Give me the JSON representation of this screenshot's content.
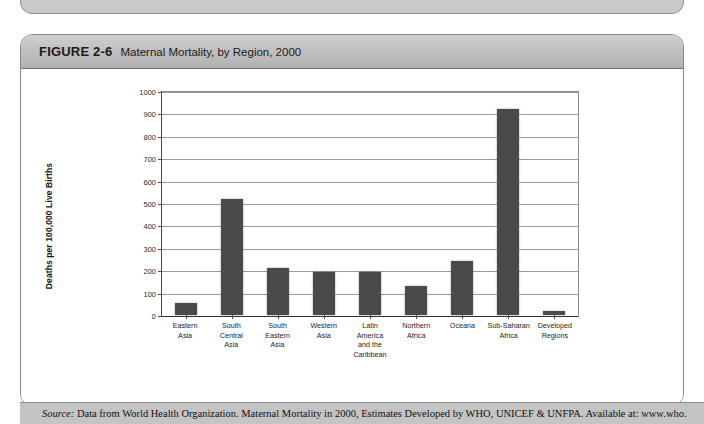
{
  "figure": {
    "number": "FIGURE 2-6",
    "title": "Maternal Mortality, by Region, 2000"
  },
  "source": {
    "label": "Source:",
    "text": " Data from World Health Organization. Maternal Mortality in 2000, Estimates Developed by WHO, UNICEF & UNFPA. Available at: www.who."
  },
  "chart_data": {
    "type": "bar",
    "title": "Maternal Mortality, by Region, 2000",
    "xlabel": "REGION/GROUP",
    "ylabel": "Deaths per 100,000 Live Births",
    "ylim": [
      0,
      1000
    ],
    "ytick_step": 100,
    "yticks": [
      "1000",
      "900",
      "800",
      "700",
      "600",
      "500",
      "400",
      "300",
      "200",
      "100",
      "0"
    ],
    "grid": true,
    "legend": false,
    "bar_color": "#4a4a4a",
    "categories": [
      "Eastern\nAsia",
      "South\nCentral\nAsia",
      "South\nEastern\nAsia",
      "Western\nAsia",
      "Latin\nAmerica\nand the\nCaribbean",
      "Northern\nAfrica",
      "Oceana",
      "Sub-Saharan\nAfrica",
      "Developed\nRegions"
    ],
    "category_lines": [
      [
        "Eastern",
        "Asia"
      ],
      [
        "South",
        "Central",
        "Asia"
      ],
      [
        "South",
        "Eastern",
        "Asia"
      ],
      [
        "Western",
        "Asia"
      ],
      [
        "Latin",
        "America",
        "and the",
        "Caribbean"
      ],
      [
        "Northern",
        "Africa"
      ],
      [
        "Oceana"
      ],
      [
        "Sub-Saharan",
        "Africa"
      ],
      [
        "Developed",
        "Regions"
      ]
    ],
    "values": [
      55,
      520,
      210,
      190,
      190,
      130,
      240,
      920,
      20
    ]
  }
}
